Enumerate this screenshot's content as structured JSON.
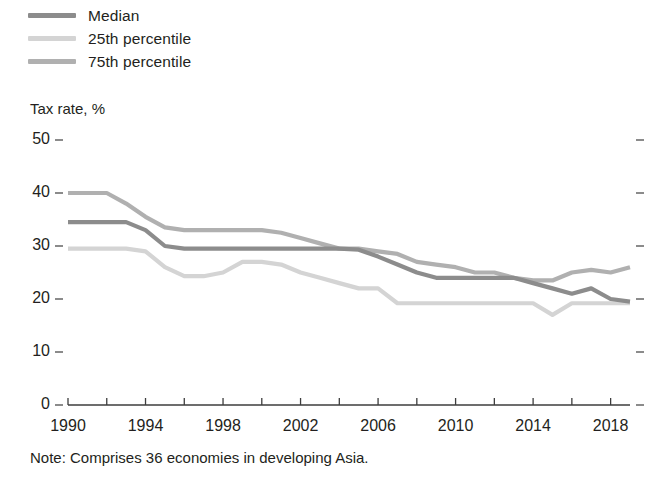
{
  "legend": {
    "position": "top-left",
    "items": [
      {
        "label": "Median",
        "color": "#8c8c8c",
        "key": "median"
      },
      {
        "label": "25th percentile",
        "color": "#d4d4d4",
        "key": "p25"
      },
      {
        "label": "75th percentile",
        "color": "#b0b0b0",
        "key": "p75"
      }
    ]
  },
  "axis_title": "Tax rate, %",
  "note": "Note: Comprises 36 economies in developing Asia.",
  "chart_data": {
    "type": "line",
    "title": "",
    "subtitle": "",
    "xlabel": "",
    "ylabel": "Tax rate, %",
    "xlim": [
      1990,
      2019
    ],
    "ylim": [
      0,
      50
    ],
    "grid": false,
    "legend_position": "top-left",
    "y_ticks": [
      0,
      10,
      20,
      30,
      40,
      50
    ],
    "x_ticks_major": [
      1990,
      1994,
      1998,
      2002,
      2006,
      2010,
      2014,
      2018
    ],
    "x_ticks_minor": [
      1992,
      1996,
      2000,
      2004,
      2008,
      2012,
      2016
    ],
    "right_axis_ticks": [
      0,
      10,
      20,
      30,
      40,
      50
    ],
    "x": [
      1990,
      1991,
      1992,
      1993,
      1994,
      1995,
      1996,
      1997,
      1998,
      1999,
      2000,
      2001,
      2002,
      2003,
      2004,
      2005,
      2006,
      2007,
      2008,
      2009,
      2010,
      2011,
      2012,
      2013,
      2014,
      2015,
      2016,
      2017,
      2018,
      2019
    ],
    "series": [
      {
        "name": "Median",
        "color": "#8c8c8c",
        "values": [
          34.5,
          34.5,
          34.5,
          34.5,
          33.0,
          30.0,
          29.5,
          29.5,
          29.5,
          29.5,
          29.5,
          29.5,
          29.5,
          29.5,
          29.5,
          29.3,
          28.0,
          26.5,
          25.0,
          24.0,
          24.0,
          24.0,
          24.0,
          24.0,
          23.0,
          22.0,
          21.0,
          22.0,
          20.0,
          19.5
        ]
      },
      {
        "name": "25th percentile",
        "color": "#d4d4d4",
        "values": [
          29.5,
          29.5,
          29.5,
          29.5,
          29.0,
          26.0,
          24.3,
          24.3,
          25.0,
          27.0,
          27.0,
          26.5,
          25.0,
          24.0,
          23.0,
          22.0,
          22.0,
          19.2,
          19.2,
          19.2,
          19.2,
          19.2,
          19.2,
          19.2,
          19.2,
          17.0,
          19.2,
          19.2,
          19.2,
          19.2
        ]
      },
      {
        "name": "75th percentile",
        "color": "#b0b0b0",
        "values": [
          40.0,
          40.0,
          40.0,
          38.0,
          35.5,
          33.5,
          33.0,
          33.0,
          33.0,
          33.0,
          33.0,
          32.5,
          31.5,
          30.5,
          29.5,
          29.5,
          29.0,
          28.5,
          27.0,
          26.5,
          26.0,
          25.0,
          25.0,
          24.0,
          23.5,
          23.5,
          25.0,
          25.5,
          25.0,
          26.0
        ]
      }
    ]
  }
}
